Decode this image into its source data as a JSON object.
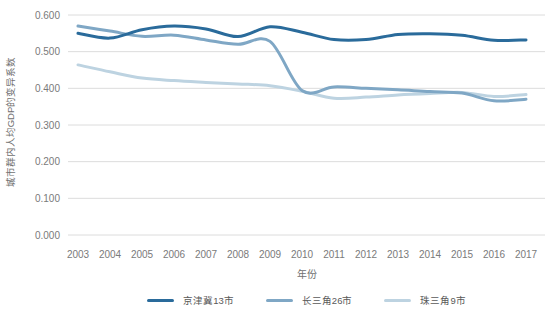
{
  "chart_data": {
    "type": "line",
    "title": "",
    "xlabel": "年份",
    "ylabel": "城市群内人均GDP的变异系数",
    "x": [
      2003,
      2004,
      2005,
      2006,
      2007,
      2008,
      2009,
      2010,
      2011,
      2012,
      2013,
      2014,
      2015,
      2016,
      2017
    ],
    "series": [
      {
        "name": "京津冀13市",
        "color": "#2a6b9b",
        "values": [
          0.55,
          0.537,
          0.56,
          0.57,
          0.562,
          0.541,
          0.568,
          0.553,
          0.533,
          0.533,
          0.547,
          0.549,
          0.545,
          0.531,
          0.532
        ]
      },
      {
        "name": "长三角26市",
        "color": "#7fa7c5",
        "values": [
          0.57,
          0.556,
          0.542,
          0.545,
          0.532,
          0.52,
          0.528,
          0.394,
          0.404,
          0.4,
          0.396,
          0.391,
          0.387,
          0.366,
          0.37
        ]
      },
      {
        "name": "珠三角9市",
        "color": "#bdd3e1",
        "values": [
          0.464,
          0.445,
          0.428,
          0.421,
          0.416,
          0.412,
          0.407,
          0.392,
          0.373,
          0.376,
          0.382,
          0.386,
          0.389,
          0.378,
          0.383
        ]
      }
    ],
    "ylim": [
      0,
      0.6
    ],
    "ytick_step": 0.1,
    "ytick_decimals": 3,
    "grid": true,
    "legend_position": "bottom"
  },
  "style": {
    "background": "#ffffff",
    "grid_color": "#dcdcdc",
    "tick_label_color": "#7a7a7a",
    "axis_title_color": "#6f6f6f",
    "legend_text_color": "#595959"
  }
}
